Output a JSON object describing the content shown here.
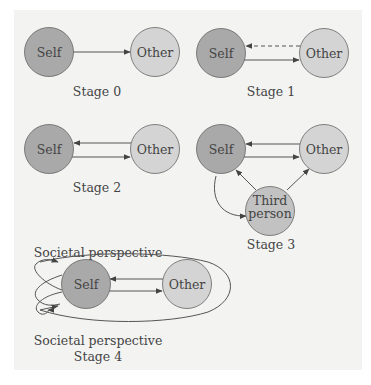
{
  "colors": {
    "background": "#ffffff",
    "panel": "#f3f3f2",
    "self_fill": "#a9a9a9",
    "other_fill": "#d4d4d4",
    "third_fill": "#c2c2c2",
    "stroke": "#555555",
    "text": "#444444"
  },
  "nodes": {
    "self": "Self",
    "other": "Other",
    "third_line1": "Third",
    "third_line2": "person"
  },
  "stages": [
    {
      "id": 0,
      "label": "Stage 0",
      "relations": [
        "Self → Other"
      ]
    },
    {
      "id": 1,
      "label": "Stage 1",
      "relations": [
        "Self → Other",
        "Other ⇢ Self (dashed)"
      ]
    },
    {
      "id": 2,
      "label": "Stage 2",
      "relations": [
        "Self → Other",
        "Other → Self"
      ]
    },
    {
      "id": 3,
      "label": "Stage 3",
      "relations": [
        "Self → Other",
        "Other → Self",
        "Self → Third person",
        "Third person → Self",
        "Third person → Other"
      ]
    },
    {
      "id": 4,
      "label_line1": "Societal perspective",
      "label_line2": "Stage 4",
      "top_label": "Societal perspective",
      "relations": [
        "Self → Other",
        "Other → Self",
        "Societal loops around Self and Other"
      ]
    }
  ]
}
